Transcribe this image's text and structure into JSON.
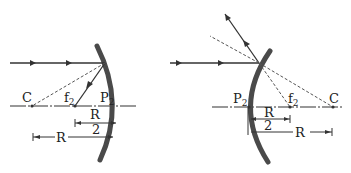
{
  "figure": {
    "concave_mirror": {
      "labels": {
        "center": "C",
        "focus": "f",
        "focus_sub": "2",
        "pole": "P",
        "pole_sub": "2",
        "half_radius_top": "R",
        "half_radius_bottom": "2",
        "radius": "R"
      }
    },
    "convex_mirror": {
      "labels": {
        "pole": "P",
        "pole_sub": "2",
        "focus": "f",
        "focus_sub": "2",
        "center": "C",
        "half_radius_top": "R",
        "half_radius_bottom": "2",
        "radius": "R"
      }
    }
  }
}
